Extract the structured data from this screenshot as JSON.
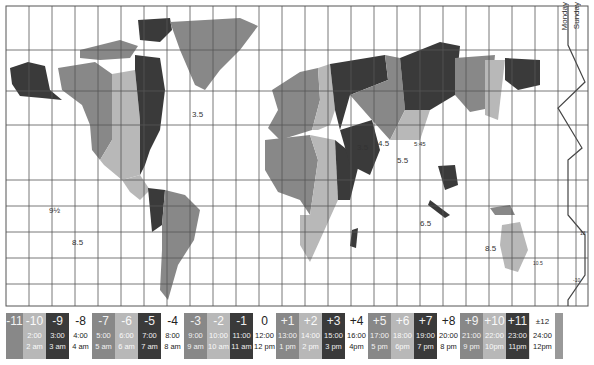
{
  "map": {
    "title": "World Time Zones",
    "day_labels": [
      "Monday",
      "Sunday"
    ],
    "annotations": [
      {
        "text": "3.5",
        "x": 192,
        "y": 117
      },
      {
        "text": "3.5",
        "x": 357,
        "y": 150
      },
      {
        "text": "4.5",
        "x": 378,
        "y": 146
      },
      {
        "text": "5.5",
        "x": 397,
        "y": 163
      },
      {
        "text": "5:45",
        "x": 414,
        "y": 146
      },
      {
        "text": "6.5",
        "x": 420,
        "y": 226
      },
      {
        "text": "9½",
        "x": 49,
        "y": 212
      },
      {
        "text": "8.5",
        "x": 72,
        "y": 245
      },
      {
        "text": "8.5",
        "x": 485,
        "y": 251
      },
      {
        "text": "10.5",
        "x": 533,
        "y": 264
      },
      {
        "text": "13",
        "x": 580,
        "y": 235
      },
      {
        "text": "-10",
        "x": 573,
        "y": 282
      }
    ],
    "colors": {
      "dark": "#3a3a3a",
      "medium": "#888888",
      "light": "#b8b8b8",
      "white": "#ffffff",
      "grid": "#555555"
    }
  },
  "legend": [
    {
      "offset": "-11",
      "h24": "",
      "h12": "",
      "shade": "m"
    },
    {
      "offset": "-10",
      "h24": "2:00",
      "h12": "2 am",
      "shade": "l"
    },
    {
      "offset": "-9",
      "h24": "3:00",
      "h12": "3 am",
      "shade": "d"
    },
    {
      "offset": "-8",
      "h24": "4:00",
      "h12": "4 am",
      "shade": "w"
    },
    {
      "offset": "-7",
      "h24": "5:00",
      "h12": "5 am",
      "shade": "m"
    },
    {
      "offset": "-6",
      "h24": "6:00",
      "h12": "6 am",
      "shade": "l"
    },
    {
      "offset": "-5",
      "h24": "7:00",
      "h12": "7 am",
      "shade": "d"
    },
    {
      "offset": "-4",
      "h24": "8:00",
      "h12": "8 am",
      "shade": "w"
    },
    {
      "offset": "-3",
      "h24": "9:00",
      "h12": "9 am",
      "shade": "m"
    },
    {
      "offset": "-2",
      "h24": "10:00",
      "h12": "10 am",
      "shade": "l"
    },
    {
      "offset": "-1",
      "h24": "11:00",
      "h12": "11 am",
      "shade": "d"
    },
    {
      "offset": "0",
      "h24": "12:00",
      "h12": "12 pm",
      "shade": "w"
    },
    {
      "offset": "+1",
      "h24": "13:00",
      "h12": "1 pm",
      "shade": "m"
    },
    {
      "offset": "+2",
      "h24": "14:00",
      "h12": "2 pm",
      "shade": "l"
    },
    {
      "offset": "+3",
      "h24": "15:00",
      "h12": "3 pm",
      "shade": "d"
    },
    {
      "offset": "+4",
      "h24": "16:00",
      "h12": "4pm",
      "shade": "w"
    },
    {
      "offset": "+5",
      "h24": "17:00",
      "h12": "5 pm",
      "shade": "m"
    },
    {
      "offset": "+6",
      "h24": "18:00",
      "h12": "6pm",
      "shade": "l"
    },
    {
      "offset": "+7",
      "h24": "19:00",
      "h12": "7 pm",
      "shade": "d"
    },
    {
      "offset": "+8",
      "h24": "20:00",
      "h12": "8 pm",
      "shade": "w"
    },
    {
      "offset": "+9",
      "h24": "21:00",
      "h12": "9 pm",
      "shade": "m"
    },
    {
      "offset": "+10",
      "h24": "22:00",
      "h12": "10pm",
      "shade": "l"
    },
    {
      "offset": "+11",
      "h24": "23:00",
      "h12": "11pm",
      "shade": "d"
    },
    {
      "offset": "±12",
      "h24": "24:00",
      "h12": "12pm",
      "shade": "w"
    }
  ]
}
